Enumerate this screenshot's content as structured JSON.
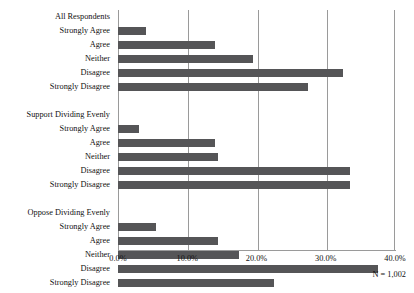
{
  "chart_data": {
    "type": "bar",
    "orientation": "horizontal",
    "title": "",
    "subtitle": "",
    "xlabel": "",
    "ylabel": "",
    "xlim": [
      0,
      40
    ],
    "xticks": [
      "0.0%",
      "10.0%",
      "20.0%",
      "30.0%",
      "40.0%"
    ],
    "xtick_values": [
      0,
      10,
      20,
      30,
      40
    ],
    "grid": true,
    "legend": false,
    "annotation": "N = 1,002",
    "bar_color": "#555557",
    "grid_color": "#9a9a9a",
    "groups": [
      {
        "name": "All Respondents",
        "categories": [
          "Strongly Agree",
          "Agree",
          "Neither",
          "Disagree",
          "Strongly Disagree"
        ],
        "values": [
          4.0,
          14.0,
          19.5,
          32.5,
          27.5
        ]
      },
      {
        "name": "Support Dividing Evenly",
        "categories": [
          "Strongly Agree",
          "Agree",
          "Neither",
          "Disagree",
          "Strongly Disagree"
        ],
        "values": [
          3.0,
          14.0,
          14.5,
          33.5,
          33.5
        ]
      },
      {
        "name": "Oppose Dividing Evenly",
        "categories": [
          "Strongly Agree",
          "Agree",
          "Neither",
          "Disagree",
          "Strongly Disagree"
        ],
        "values": [
          5.5,
          14.5,
          17.5,
          37.5,
          22.5
        ]
      }
    ]
  }
}
